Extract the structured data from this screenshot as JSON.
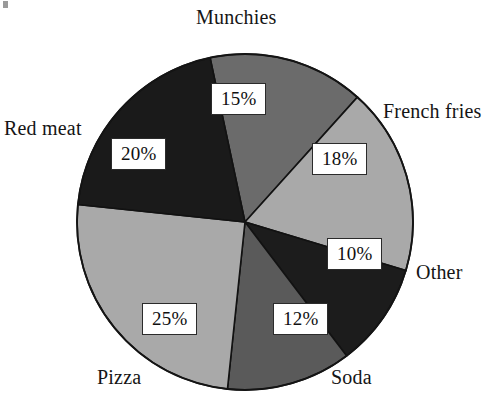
{
  "chart_data": {
    "type": "pie",
    "title": "",
    "subtitle": "",
    "xlabel": "",
    "ylabel": "",
    "legend_position": "around-slices",
    "grid": false,
    "units": "percent",
    "total": 100,
    "categories": [
      "Munchies",
      "French fries",
      "Other",
      "Soda",
      "Pizza",
      "Red meat"
    ],
    "values": [
      15,
      18,
      10,
      12,
      25,
      20
    ],
    "value_labels": [
      "15%",
      "18%",
      "10%",
      "12%",
      "25%",
      "20%"
    ],
    "slice_colors": [
      "#6b6b6b",
      "#a9a9a9",
      "#1c1c1c",
      "#5a5a5a",
      "#a9a9a9",
      "#1a1a1a"
    ],
    "start_angle_deg": -12,
    "direction": "clockwise",
    "slices": [
      {
        "label": "Munchies",
        "value": 15,
        "value_label": "15%",
        "color": "#6b6b6b"
      },
      {
        "label": "French fries",
        "value": 18,
        "value_label": "18%",
        "color": "#a9a9a9"
      },
      {
        "label": "Other",
        "value": 10,
        "value_label": "10%",
        "color": "#1c1c1c"
      },
      {
        "label": "Soda",
        "value": 12,
        "value_label": "12%",
        "color": "#5a5a5a"
      },
      {
        "label": "Pizza",
        "value": 25,
        "value_label": "25%",
        "color": "#a9a9a9"
      },
      {
        "label": "Red meat",
        "value": 20,
        "value_label": "20%",
        "color": "#1a1a1a"
      }
    ]
  },
  "labels": {
    "munchies": "Munchies",
    "french_fries": "French fries",
    "other": "Other",
    "soda": "Soda",
    "pizza": "Pizza",
    "red_meat": "Red meat"
  },
  "percents": {
    "munchies": "15%",
    "french_fries": "18%",
    "other": "10%",
    "soda": "12%",
    "pizza": "25%",
    "red_meat": "20%"
  },
  "colors": {
    "background": "#ffffff",
    "outline": "#1a1a1a",
    "text": "#151515",
    "light_gray": "#a9a9a9",
    "mid_gray": "#6b6b6b",
    "dark_gray": "#5a5a5a",
    "near_black": "#1a1a1a"
  }
}
